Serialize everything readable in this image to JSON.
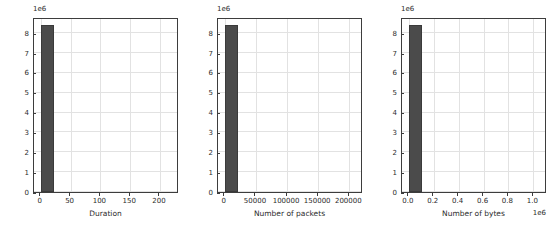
{
  "figure": {
    "background": "#ffffff",
    "bar_color": "#4b4b4b",
    "grid_color": "#e2e2e2",
    "axis_color": "#3d3d3d"
  },
  "chart_data": [
    {
      "type": "bar",
      "title": "",
      "xlabel": "Duration",
      "ylabel": "",
      "y_offset_text": "1e6",
      "x_offset_text": "",
      "xlim": [
        -11.5,
        232.0
      ],
      "ylim": [
        0,
        8820000
      ],
      "grid": true,
      "legend": "none",
      "yticks": [
        "0",
        "1",
        "2",
        "3",
        "4",
        "5",
        "6",
        "7",
        "8"
      ],
      "ytick_values": [
        0,
        1000000,
        2000000,
        3000000,
        4000000,
        5000000,
        6000000,
        7000000,
        8000000
      ],
      "xticks": [
        "0",
        "50",
        "100",
        "150",
        "200"
      ],
      "xtick_values": [
        0,
        50,
        100,
        150,
        200
      ],
      "bars": [
        {
          "x_start": 0,
          "x_end": 22,
          "value": 8420000
        }
      ]
    },
    {
      "type": "bar",
      "title": "",
      "xlabel": "Number of packets",
      "ylabel": "",
      "y_offset_text": "1e6",
      "x_offset_text": "",
      "xlim": [
        -11000,
        222000
      ],
      "ylim": [
        0,
        8820000
      ],
      "grid": true,
      "legend": "none",
      "yticks": [
        "0",
        "1",
        "2",
        "3",
        "4",
        "5",
        "6",
        "7",
        "8"
      ],
      "ytick_values": [
        0,
        1000000,
        2000000,
        3000000,
        4000000,
        5000000,
        6000000,
        7000000,
        8000000
      ],
      "xticks": [
        "0",
        "50000",
        "100000",
        "150000",
        "200000"
      ],
      "xtick_values": [
        0,
        50000,
        100000,
        150000,
        200000
      ],
      "bars": [
        {
          "x_start": 0,
          "x_end": 21000,
          "value": 8430000
        }
      ]
    },
    {
      "type": "bar",
      "title": "",
      "xlabel": "Number of bytes",
      "ylabel": "",
      "y_offset_text": "1e6",
      "x_offset_text": "1e6",
      "xlim": [
        -55000,
        1110000
      ],
      "ylim": [
        0,
        8820000
      ],
      "grid": true,
      "legend": "none",
      "yticks": [
        "0",
        "1",
        "2",
        "3",
        "4",
        "5",
        "6",
        "7",
        "8"
      ],
      "ytick_values": [
        0,
        1000000,
        2000000,
        3000000,
        4000000,
        5000000,
        6000000,
        7000000,
        8000000
      ],
      "xticks": [
        "0.0",
        "0.2",
        "0.4",
        "0.6",
        "0.8",
        "1.0"
      ],
      "xtick_values": [
        0,
        200000,
        400000,
        600000,
        800000,
        1000000
      ],
      "bars": [
        {
          "x_start": 0,
          "x_end": 105000,
          "value": 8410000
        }
      ]
    }
  ]
}
